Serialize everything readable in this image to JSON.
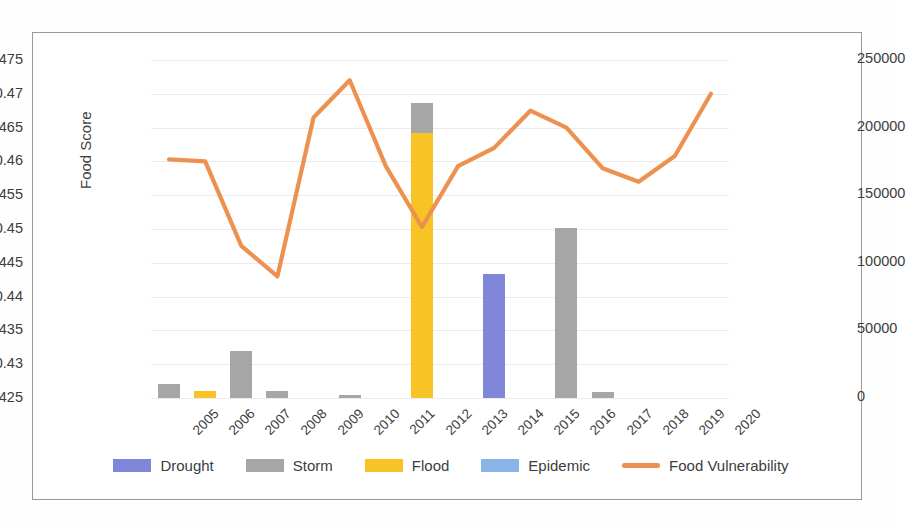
{
  "chart_data": {
    "type": "bar",
    "title": "",
    "xlabel": "",
    "ylabel": "Food Score",
    "y2label": "",
    "categories": [
      "2005",
      "2006",
      "2007",
      "2008",
      "2009",
      "2010",
      "2011",
      "2012",
      "2013",
      "2014",
      "2015",
      "2016",
      "2017",
      "2018",
      "2019",
      "2020"
    ],
    "ylim": [
      0.425,
      0.475
    ],
    "ytick_step": 0.005,
    "yticks": [
      "0.475",
      "0.47",
      "0.465",
      "0.46",
      "0.455",
      "0.45",
      "0.445",
      "0.44",
      "0.435",
      "0.43",
      "0.425"
    ],
    "y2lim": [
      0,
      250000
    ],
    "y2tick_step": 50000,
    "y2ticks": [
      "250000",
      "200000",
      "150000",
      "100000",
      "50000",
      "0"
    ],
    "grid": true,
    "legend_position": "bottom",
    "series": [
      {
        "name": "Drought",
        "type": "bar",
        "axis": "secondary",
        "color": "#8086d8",
        "values": [
          0,
          0,
          0,
          0,
          0,
          0,
          0,
          0,
          0,
          92000,
          0,
          0,
          0,
          0,
          0,
          0
        ]
      },
      {
        "name": "Storm",
        "type": "bar",
        "axis": "secondary",
        "color": "#a6a6a6",
        "values": [
          10500,
          0,
          35000,
          5000,
          0,
          2500,
          0,
          218000,
          0,
          0,
          0,
          126000,
          4500,
          0,
          0,
          0
        ]
      },
      {
        "name": "Flood",
        "type": "bar",
        "axis": "secondary",
        "color": "#f7c325",
        "values": [
          0,
          5500,
          0,
          0,
          0,
          0,
          0,
          196000,
          0,
          0,
          0,
          0,
          0,
          0,
          0,
          0
        ]
      },
      {
        "name": "Epidemic",
        "type": "bar",
        "axis": "secondary",
        "color": "#8ab4e8",
        "values": [
          0,
          0,
          0,
          0,
          0,
          0,
          0,
          0,
          0,
          0,
          0,
          0,
          0,
          0,
          0,
          0
        ]
      },
      {
        "name": "Food Vulnerability",
        "type": "line",
        "axis": "primary",
        "color": "#ed9150",
        "values": [
          0.4603,
          0.46,
          0.4475,
          0.443,
          0.4665,
          0.472,
          0.4593,
          0.4503,
          0.4593,
          0.462,
          0.4675,
          0.465,
          0.459,
          0.457,
          0.4608,
          0.47
        ]
      }
    ]
  },
  "legend": {
    "items": [
      {
        "label": "Drought",
        "color": "#8086d8",
        "kind": "bar"
      },
      {
        "label": "Storm",
        "color": "#a6a6a6",
        "kind": "bar"
      },
      {
        "label": "Flood",
        "color": "#f7c325",
        "kind": "bar"
      },
      {
        "label": "Epidemic",
        "color": "#8ab4e8",
        "kind": "bar"
      },
      {
        "label": "Food Vulnerability",
        "color": "#ed9150",
        "kind": "line"
      }
    ]
  }
}
